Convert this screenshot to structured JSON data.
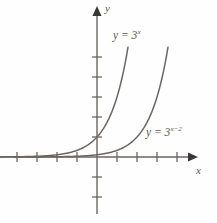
{
  "figure": {
    "title": "",
    "background_color": "#fefefe",
    "line_color": "#6b6560",
    "text_color": "#5b5550"
  },
  "axes": {
    "x_label": "x",
    "y_label": "y",
    "origin_px": [
      97,
      157
    ],
    "unit_px": 20,
    "x_ticks": [
      -4,
      -3,
      -2,
      -1,
      1,
      2,
      3,
      4
    ],
    "y_ticks": [
      -2,
      -1,
      1,
      2,
      3,
      4,
      5
    ],
    "x_range": [
      -4.8,
      4.8
    ],
    "y_range": [
      -3.2,
      6.5
    ],
    "grid": false
  },
  "curves": [
    {
      "id": "curve1",
      "label_html": "y = 3",
      "label_exponent": "x",
      "expression": "y = 3^x",
      "base": 3,
      "shift": 0,
      "color": "#6b6560",
      "y_intercept": 1,
      "label_position_px": [
        113,
        30
      ]
    },
    {
      "id": "curve2",
      "label_html": "y = 3",
      "label_exponent": "x−2",
      "expression": "y = 3^(x-2)",
      "base": 3,
      "shift": 2,
      "color": "#6b6560",
      "y_intercept": 0.1111,
      "label_position_px": [
        146,
        127
      ]
    }
  ],
  "chart_data": {
    "type": "line",
    "title": "",
    "xlabel": "x",
    "ylabel": "y",
    "xlim": [
      -4.8,
      4.8
    ],
    "ylim": [
      -3.2,
      6.5
    ],
    "grid": false,
    "legend": "inline-annotations",
    "xticks": [
      -4,
      -3,
      -2,
      -1,
      1,
      2,
      3,
      4
    ],
    "yticks": [
      -2,
      -1,
      1,
      2,
      3,
      4,
      5
    ],
    "series": [
      {
        "name": "y = 3^x",
        "x": [
          -4,
          -3.5,
          -3,
          -2.5,
          -2,
          -1.5,
          -1,
          -0.5,
          0,
          0.25,
          0.5,
          0.75,
          1,
          1.25,
          1.5,
          1.75
        ],
        "values": [
          0.0123,
          0.0214,
          0.037,
          0.0641,
          0.1111,
          0.1925,
          0.3333,
          0.5774,
          1,
          1.3161,
          1.7321,
          2.2795,
          3,
          3.9482,
          5.1962,
          6.8385
        ]
      },
      {
        "name": "y = 3^(x-2)",
        "x": [
          -2,
          -1.5,
          -1,
          -0.5,
          0,
          0.5,
          1,
          1.5,
          2,
          2.25,
          2.5,
          2.75,
          3,
          3.25,
          3.5,
          3.75
        ],
        "values": [
          0.0014,
          0.0024,
          0.0041,
          0.0071,
          0.1111,
          0.1925,
          0.3333,
          0.5774,
          1,
          1.3161,
          1.7321,
          2.2795,
          3,
          3.9482,
          5.1962,
          6.8385
        ]
      }
    ]
  }
}
